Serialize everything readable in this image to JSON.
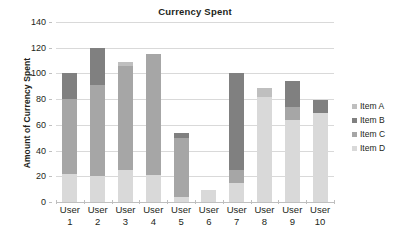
{
  "chart_data": {
    "type": "bar",
    "title": "Currency Spent",
    "xlabel": "",
    "ylabel": "Amount of Currency Spent",
    "ylim": [
      0,
      140
    ],
    "ytick_step": 20,
    "yticks": [
      0,
      20,
      40,
      60,
      80,
      100,
      120,
      140
    ],
    "grid": "horizontal",
    "stacked": true,
    "legend_position": "right",
    "categories": [
      "User 1",
      "User 2",
      "User 3",
      "User 4",
      "User 5",
      "User 6",
      "User 7",
      "User 8",
      "User 9",
      "User 10"
    ],
    "category_lines": [
      [
        "User",
        "1"
      ],
      [
        "User",
        "2"
      ],
      [
        "User",
        "3"
      ],
      [
        "User",
        "4"
      ],
      [
        "User",
        "5"
      ],
      [
        "User",
        "6"
      ],
      [
        "User",
        "7"
      ],
      [
        "User",
        "8"
      ],
      [
        "User",
        "9"
      ],
      [
        "User",
        "10"
      ]
    ],
    "series": [
      {
        "name": "Item A",
        "color": "#bfbfbf",
        "values": [
          0,
          0,
          3,
          0,
          0,
          0,
          0,
          7,
          0,
          0
        ]
      },
      {
        "name": "Item B",
        "color": "#808080",
        "values": [
          20,
          29,
          0,
          0,
          4,
          0,
          75,
          0,
          20,
          10
        ]
      },
      {
        "name": "Item C",
        "color": "#a6a6a6",
        "values": [
          58,
          71,
          81,
          94,
          46,
          0,
          10,
          0,
          10,
          0
        ]
      },
      {
        "name": "Item D",
        "color": "#d9d9d9",
        "values": [
          22,
          20,
          25,
          21,
          4,
          9,
          15,
          82,
          64,
          69
        ]
      }
    ],
    "totals": [
      100,
      120,
      109,
      115,
      54,
      9,
      100,
      89,
      94,
      79
    ],
    "stack_order": [
      "Item D",
      "Item C",
      "Item B",
      "Item A"
    ]
  },
  "legend": {
    "items": [
      {
        "label": "Item A"
      },
      {
        "label": "Item B"
      },
      {
        "label": "Item C"
      },
      {
        "label": "Item D"
      }
    ]
  }
}
